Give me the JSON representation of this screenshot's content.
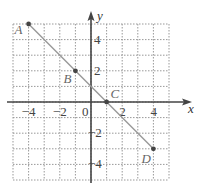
{
  "chart_data": {
    "type": "line",
    "title": "",
    "xlabel": "x",
    "ylabel": "y",
    "xlim": [
      -5,
      5
    ],
    "ylim": [
      -5,
      5
    ],
    "grid": true,
    "x_ticks": [
      -4,
      -2,
      0,
      2,
      4
    ],
    "y_ticks": [
      4,
      2,
      -2,
      -4
    ],
    "x_tick_labels": [
      "−4",
      "−2",
      "0",
      "2",
      "4"
    ],
    "y_tick_labels": [
      "4",
      "2",
      "−2",
      "−4"
    ],
    "points": [
      {
        "label": "A",
        "x": -4,
        "y": 5
      },
      {
        "label": "B",
        "x": -1,
        "y": 2
      },
      {
        "label": "C",
        "x": 1,
        "y": 0
      },
      {
        "label": "D",
        "x": 4,
        "y": -3
      }
    ],
    "series": [
      {
        "name": "line AD",
        "x": [
          -4,
          4
        ],
        "y": [
          5,
          -3
        ]
      }
    ]
  },
  "colors": {
    "axis": "#444444",
    "grid": "#999999",
    "line": "#999999",
    "point": "#444444"
  }
}
